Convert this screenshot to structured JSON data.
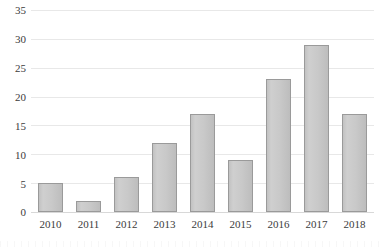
{
  "chart_data": {
    "type": "bar",
    "title": "",
    "subtitle": "",
    "xlabel": "",
    "ylabel": "",
    "categories": [
      "2010",
      "2011",
      "2012",
      "2013",
      "2014",
      "2015",
      "2016",
      "2017",
      "2018"
    ],
    "values": [
      5,
      2,
      6,
      12,
      17,
      9,
      23,
      29,
      17
    ],
    "series": [
      {
        "name": "",
        "values": [
          5,
          2,
          6,
          12,
          17,
          9,
          23,
          29,
          17
        ]
      }
    ],
    "ylim": [
      0,
      35
    ],
    "yticks": [
      0,
      5,
      10,
      15,
      20,
      25,
      30,
      35
    ],
    "ytick_labels": [
      "0",
      "5",
      "10",
      "15",
      "20",
      "25",
      "30",
      "35"
    ],
    "grid": true,
    "grid_axis": "y",
    "legend": false,
    "legend_position": "none",
    "annotations": []
  },
  "style": {
    "bar_fill": "#c9c9c9",
    "bar_border": "#9a9a9a",
    "gridline_color": "#e8e8e8",
    "baseline_color": "#d8d8d8",
    "text_color": "#3b3b3b",
    "background": "#ffffff"
  }
}
